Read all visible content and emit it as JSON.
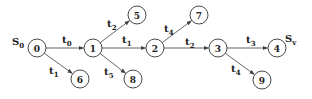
{
  "diagram": {
    "type": "directed-graph",
    "start_label": {
      "main": "S",
      "sub": "0",
      "x": 12,
      "y": 45
    },
    "end_label": {
      "main": "S",
      "sub": "v",
      "x": 285,
      "y": 42
    },
    "nodes": [
      {
        "id": "0",
        "label": "0",
        "x": 37,
        "y": 48
      },
      {
        "id": "1",
        "label": "1",
        "x": 93,
        "y": 48
      },
      {
        "id": "2",
        "label": "2",
        "x": 155,
        "y": 48
      },
      {
        "id": "3",
        "label": "3",
        "x": 218,
        "y": 48
      },
      {
        "id": "4",
        "label": "4",
        "x": 277,
        "y": 48
      },
      {
        "id": "5",
        "label": "5",
        "x": 137,
        "y": 15
      },
      {
        "id": "6",
        "label": "6",
        "x": 80,
        "y": 79
      },
      {
        "id": "7",
        "label": "7",
        "x": 199,
        "y": 15
      },
      {
        "id": "8",
        "label": "8",
        "x": 133,
        "y": 79
      },
      {
        "id": "9",
        "label": "9",
        "x": 262,
        "y": 80
      }
    ],
    "edges": [
      {
        "from": "0",
        "to": "1",
        "label": "t",
        "sub": "0",
        "lx": 62,
        "ly": 43
      },
      {
        "from": "0",
        "to": "6",
        "label": "t",
        "sub": "1",
        "lx": 49,
        "ly": 74
      },
      {
        "from": "1",
        "to": "5",
        "label": "t",
        "sub": "2",
        "lx": 107,
        "ly": 27
      },
      {
        "from": "1",
        "to": "2",
        "label": "t",
        "sub": "1",
        "lx": 122,
        "ly": 43
      },
      {
        "from": "1",
        "to": "8",
        "label": "t",
        "sub": "5",
        "lx": 104,
        "ly": 75
      },
      {
        "from": "2",
        "to": "7",
        "label": "t",
        "sub": "4",
        "lx": 164,
        "ly": 32
      },
      {
        "from": "2",
        "to": "3",
        "label": "t",
        "sub": "2",
        "lx": 185,
        "ly": 45
      },
      {
        "from": "3",
        "to": "4",
        "label": "t",
        "sub": "3",
        "lx": 246,
        "ly": 43
      },
      {
        "from": "3",
        "to": "9",
        "label": "t",
        "sub": "4",
        "lx": 231,
        "ly": 72
      }
    ],
    "node_radius": 9,
    "colors": {
      "stroke": "#333333",
      "edge": "#555555",
      "text": "#222222",
      "background": "#ffffff"
    }
  }
}
